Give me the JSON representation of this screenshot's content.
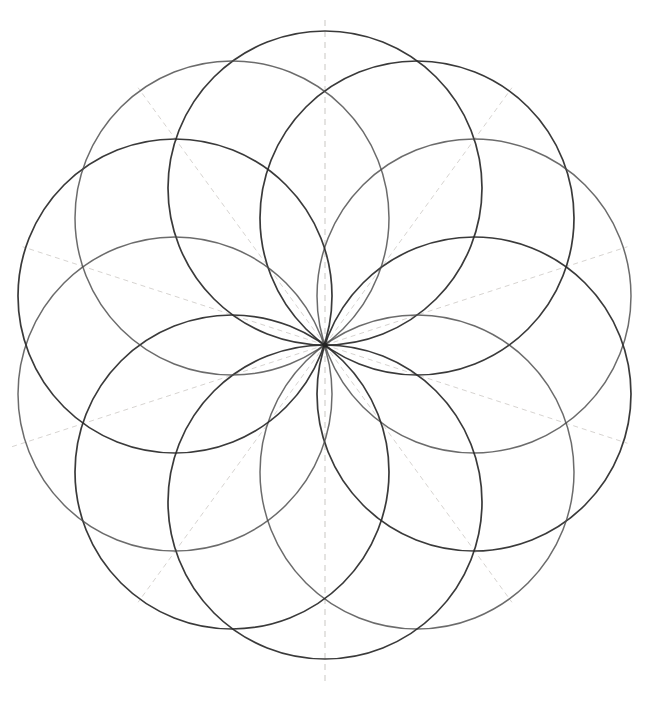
{
  "document": {
    "title": "Ten-circle rosette geometric construction",
    "medium": "pencil on paper",
    "background_color": "#ffffff",
    "ink_color": "#2b2b2b",
    "guide_color": "#b8b4ae"
  },
  "canvas": {
    "width": 657,
    "height": 703
  },
  "chart_data": {
    "type": "scatter",
    "title": "Ten-circle rosette geometric construction",
    "xlabel": "",
    "ylabel": "",
    "grid": false,
    "legend_position": "none",
    "xlim": [
      0,
      657
    ],
    "ylim": [
      0,
      703
    ],
    "center": {
      "x": 325,
      "y": 345
    },
    "circle_count": 10,
    "circle_radius": 157,
    "center_ring_radius": 157,
    "start_angle_deg": -90,
    "angle_step_deg": 36,
    "petal_count": 10,
    "figure_bounds": {
      "left": 36,
      "top": 38,
      "right": 624,
      "bottom": 655
    },
    "circles": [
      {
        "index": 1,
        "angle_deg": -90,
        "cx": 325,
        "cy": 188,
        "r": 157,
        "shade": "dark"
      },
      {
        "index": 2,
        "angle_deg": -54,
        "cx": 417,
        "cy": 218,
        "r": 157,
        "shade": "dark"
      },
      {
        "index": 3,
        "angle_deg": -18,
        "cx": 474,
        "cy": 296,
        "r": 157,
        "shade": "pale"
      },
      {
        "index": 4,
        "angle_deg": 18,
        "cx": 474,
        "cy": 394,
        "r": 157,
        "shade": "dark"
      },
      {
        "index": 5,
        "angle_deg": 54,
        "cx": 417,
        "cy": 472,
        "r": 157,
        "shade": "pale"
      },
      {
        "index": 6,
        "angle_deg": 90,
        "cx": 325,
        "cy": 502,
        "r": 157,
        "shade": "dark"
      },
      {
        "index": 7,
        "angle_deg": 126,
        "cx": 232,
        "cy": 472,
        "r": 157,
        "shade": "dark"
      },
      {
        "index": 8,
        "angle_deg": 162,
        "cx": 175,
        "cy": 394,
        "r": 157,
        "shade": "pale"
      },
      {
        "index": 9,
        "angle_deg": 198,
        "cx": 175,
        "cy": 296,
        "r": 157,
        "shade": "dark"
      },
      {
        "index": 10,
        "angle_deg": 234,
        "cx": 232,
        "cy": 218,
        "r": 157,
        "shade": "pale"
      }
    ],
    "guide_rays": [
      {
        "index": 1,
        "angle_deg": -90,
        "length": 330,
        "label": "vertical axis up"
      },
      {
        "index": 2,
        "angle_deg": -54,
        "length": 318,
        "label": "ray -54"
      },
      {
        "index": 3,
        "angle_deg": -18,
        "length": 318,
        "label": "ray -18"
      },
      {
        "index": 4,
        "angle_deg": 18,
        "length": 318,
        "label": "ray 18"
      },
      {
        "index": 5,
        "angle_deg": 54,
        "length": 318,
        "label": "ray 54"
      },
      {
        "index": 6,
        "angle_deg": 90,
        "length": 340,
        "label": "vertical axis down"
      },
      {
        "index": 7,
        "angle_deg": 126,
        "length": 318,
        "label": "ray 126"
      },
      {
        "index": 8,
        "angle_deg": 162,
        "length": 330,
        "label": "ray 162"
      },
      {
        "index": 9,
        "angle_deg": 198,
        "length": 318,
        "label": "ray 198"
      },
      {
        "index": 10,
        "angle_deg": 234,
        "length": 318,
        "label": "ray 234"
      }
    ]
  }
}
